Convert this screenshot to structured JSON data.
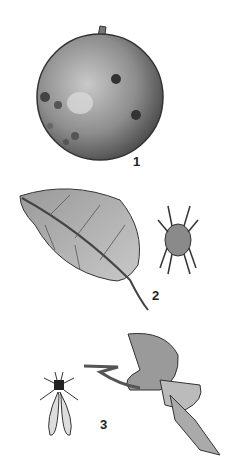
{
  "figures": [
    {
      "number": "1",
      "subject": "apple with lesions"
    },
    {
      "number": "2",
      "subject": "leaf with mite"
    },
    {
      "number": "3",
      "subject": "curled leaf with winged insect"
    }
  ],
  "colors": {
    "background": "#ffffff",
    "ink": "#222222",
    "mid": "#8a8a8a",
    "light": "#bdbdbd"
  }
}
